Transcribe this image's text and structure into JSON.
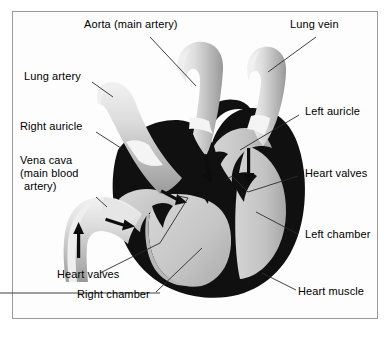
{
  "diagram": {
    "type": "anatomical-cross-section",
    "background_color": "#ffffff",
    "frame_border_color": "#9a9a9a",
    "muscle_color": "#101010",
    "chamber_fill_color": "#c9c9c9",
    "vessel_fill_color": "#d2d2d2",
    "leader_line_color": "#2b2b2b"
  },
  "labels": {
    "aorta": "Aorta (main artery)",
    "lung_vein": "Lung vein",
    "lung_artery": "Lung artery",
    "left_auricle": "Left auricle",
    "right_auricle": "Right auricle",
    "vena_cava_line1": "Vena cava",
    "vena_cava_line2": "(main blood",
    "vena_cava_line3": "artery)",
    "heart_valves_right": "Heart valves",
    "left_chamber": "Left chamber",
    "heart_valves_left": "Heart valves",
    "right_chamber": "Right chamber",
    "heart_muscle": "Heart muscle"
  },
  "flow_arrows": [
    {
      "name": "vena-cava-inflow-arrow",
      "direction": "up"
    },
    {
      "name": "right-atrium-inflow-arrow",
      "direction": "right"
    },
    {
      "name": "right-ventricle-arrow",
      "direction": "down-right"
    },
    {
      "name": "pulmonary-outflow-arrow",
      "direction": "down"
    },
    {
      "name": "left-atrium-arrow",
      "direction": "down"
    }
  ],
  "structures": [
    "aorta",
    "lung vein",
    "lung artery",
    "vena cava",
    "right auricle",
    "left auricle",
    "right chamber",
    "left chamber",
    "heart valves",
    "heart muscle"
  ]
}
